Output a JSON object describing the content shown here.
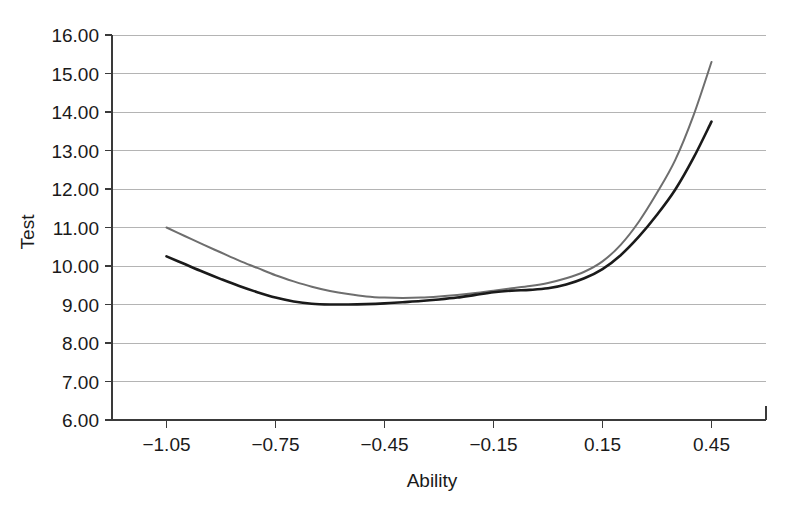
{
  "chart_data": {
    "type": "line",
    "title": "",
    "subtitle": "",
    "xlabel": "Ability",
    "ylabel": "Test",
    "xlim": [
      -1.2,
      0.6
    ],
    "ylim": [
      6.0,
      16.0
    ],
    "grid": true,
    "legend": "none",
    "x_tick_labels": [
      "-1.05",
      "-0.75",
      "-0.45",
      "-0.15",
      "0.15",
      "0.45"
    ],
    "x_tick_values": [
      -1.05,
      -0.75,
      -0.45,
      -0.15,
      0.15,
      0.45
    ],
    "y_tick_labels": [
      "6.00",
      "7.00",
      "8.00",
      "9.00",
      "10.00",
      "11.00",
      "12.00",
      "13.00",
      "14.00",
      "15.00",
      "16.00"
    ],
    "y_tick_values": [
      6,
      7,
      8,
      9,
      10,
      11,
      12,
      13,
      14,
      15,
      16
    ],
    "series": [
      {
        "name": "gray-curve",
        "color": "#6e6e6e",
        "width": 2.0,
        "x": [
          -1.05,
          -1.0,
          -0.95,
          -0.9,
          -0.85,
          -0.8,
          -0.75,
          -0.7,
          -0.65,
          -0.6,
          -0.55,
          -0.5,
          -0.45,
          -0.4,
          -0.35,
          -0.3,
          -0.25,
          -0.2,
          -0.15,
          -0.1,
          -0.05,
          0.0,
          0.05,
          0.1,
          0.15,
          0.2,
          0.25,
          0.3,
          0.35,
          0.4,
          0.45
        ],
        "values": [
          11.0,
          10.78,
          10.56,
          10.35,
          10.14,
          9.95,
          9.76,
          9.6,
          9.46,
          9.35,
          9.27,
          9.21,
          9.18,
          9.17,
          9.18,
          9.21,
          9.25,
          9.3,
          9.36,
          9.42,
          9.48,
          9.56,
          9.68,
          9.85,
          10.12,
          10.55,
          11.15,
          11.9,
          12.75,
          13.9,
          15.3
        ]
      },
      {
        "name": "black-curve",
        "color": "#1a1a1a",
        "width": 2.6,
        "x": [
          -1.05,
          -1.0,
          -0.95,
          -0.9,
          -0.85,
          -0.8,
          -0.75,
          -0.7,
          -0.65,
          -0.6,
          -0.55,
          -0.5,
          -0.45,
          -0.4,
          -0.35,
          -0.3,
          -0.25,
          -0.2,
          -0.15,
          -0.1,
          -0.05,
          0.0,
          0.05,
          0.1,
          0.15,
          0.2,
          0.25,
          0.3,
          0.35,
          0.4,
          0.45
        ],
        "values": [
          10.25,
          10.05,
          9.85,
          9.66,
          9.48,
          9.32,
          9.18,
          9.08,
          9.02,
          9.0,
          9.0,
          9.01,
          9.03,
          9.06,
          9.09,
          9.13,
          9.18,
          9.25,
          9.32,
          9.36,
          9.38,
          9.42,
          9.52,
          9.68,
          9.92,
          10.28,
          10.76,
          11.33,
          11.98,
          12.8,
          13.75
        ]
      }
    ]
  },
  "axes": {
    "y_axis_title": "Test",
    "x_axis_title": "Ability"
  }
}
